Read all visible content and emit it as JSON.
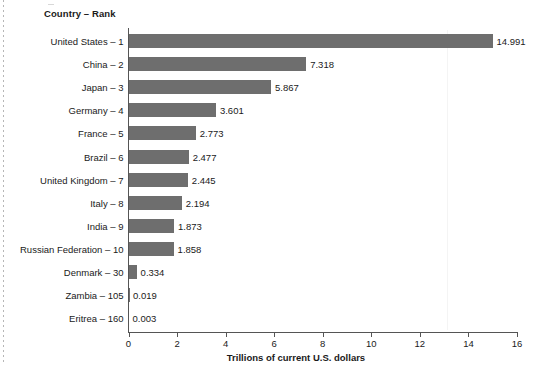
{
  "header": {
    "column_header": "Country – Rank"
  },
  "chart_data": {
    "type": "bar",
    "orientation": "horizontal",
    "title": "",
    "xlabel": "Trillions of current U.S. dollars",
    "ylabel": "Country – Rank",
    "xlim": [
      0,
      16
    ],
    "xticks": [
      "0",
      "2",
      "4",
      "6",
      "8",
      "10",
      "12",
      "14",
      "16"
    ],
    "grid": false,
    "legend": "none",
    "bar_color": "#6e6e6e",
    "axis_color": "#555555",
    "categories": [
      "United States – 1",
      "China – 2",
      "Japan – 3",
      "Germany – 4",
      "France – 5",
      "Brazil – 6",
      "United Kingdom – 7",
      "Italy – 8",
      "India – 9",
      "Russian Federation  – 10",
      "Denmark – 30",
      "Zambia – 105",
      "Eritrea – 160"
    ],
    "values": [
      14.991,
      7.318,
      5.867,
      3.601,
      2.773,
      2.477,
      2.445,
      2.194,
      1.873,
      1.858,
      0.334,
      0.019,
      0.003
    ],
    "value_labels": [
      "14.991",
      "7.318",
      "5.867",
      "3.601",
      "2.773",
      "2.477",
      "2.445",
      "2.194",
      "1.873",
      "1.858",
      "0.334",
      "0.019",
      "0.003"
    ]
  }
}
